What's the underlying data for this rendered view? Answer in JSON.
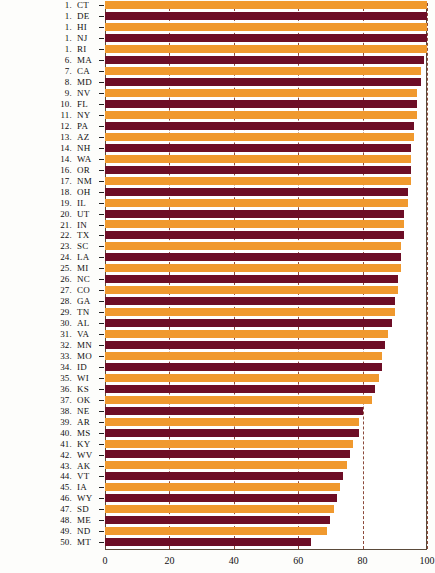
{
  "chart_data": {
    "type": "bar",
    "orientation": "horizontal",
    "title": "",
    "xlabel": "",
    "ylabel": "",
    "xlim": [
      0,
      100
    ],
    "xticks": [
      0,
      20,
      40,
      60,
      80,
      100
    ],
    "grid": "vertical-dashed",
    "legend": "none",
    "colors": {
      "odd": "#f0992e",
      "even": "#6d0d26",
      "gridline": "#7a2a18",
      "axis": "#5a4a3a"
    },
    "categories": [
      "CT",
      "DE",
      "HI",
      "NJ",
      "RI",
      "MA",
      "CA",
      "MD",
      "NV",
      "FL",
      "NY",
      "PA",
      "AZ",
      "NH",
      "WA",
      "OR",
      "NM",
      "OH",
      "IL",
      "UT",
      "IN",
      "TX",
      "SC",
      "LA",
      "MI",
      "NC",
      "CO",
      "GA",
      "TN",
      "AL",
      "VA",
      "MN",
      "MO",
      "ID",
      "WI",
      "KS",
      "OK",
      "NE",
      "AR",
      "MS",
      "KY",
      "WV",
      "AK",
      "VT",
      "IA",
      "WY",
      "SD",
      "ME",
      "ND",
      "MT"
    ],
    "ranks": [
      "1.",
      "1.",
      "1.",
      "1.",
      "1.",
      "6.",
      "7.",
      "8.",
      "9.",
      "10.",
      "11.",
      "12.",
      "13.",
      "14.",
      "14.",
      "16.",
      "17.",
      "18.",
      "19.",
      "20.",
      "21.",
      "22.",
      "23.",
      "24.",
      "25.",
      "26.",
      "27.",
      "28.",
      "29.",
      "30.",
      "31.",
      "32.",
      "33.",
      "34.",
      "35.",
      "36.",
      "37.",
      "38.",
      "39.",
      "40.",
      "41.",
      "42.",
      "43.",
      "44.",
      "45.",
      "46.",
      "47.",
      "48.",
      "49.",
      "50."
    ],
    "values": [
      100,
      100,
      100,
      100,
      100,
      99,
      98,
      98,
      97,
      97,
      97,
      96,
      96,
      95,
      95,
      95,
      95,
      94,
      94,
      93,
      93,
      93,
      92,
      92,
      92,
      91,
      91,
      90,
      90,
      89,
      88,
      87,
      86,
      86,
      85,
      84,
      83,
      80,
      79,
      79,
      77,
      76,
      75,
      74,
      73,
      72,
      71,
      70,
      69,
      64
    ]
  }
}
